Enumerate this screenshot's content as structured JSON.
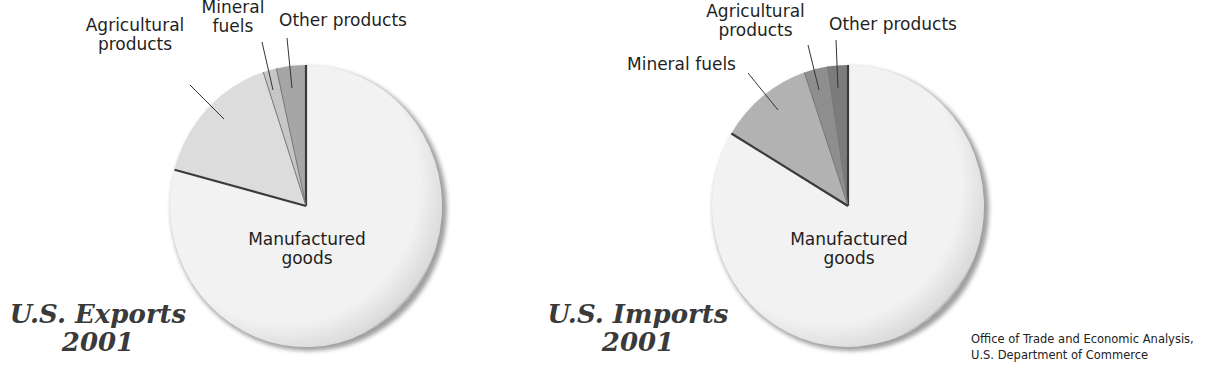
{
  "chart_data": [
    {
      "type": "pie",
      "title": "U.S. Exports 2001",
      "title_lines": [
        "U.S. Exports",
        "2001"
      ],
      "categories": [
        "Manufactured goods",
        "Agricultural products",
        "Mineral fuels",
        "Other products"
      ],
      "values": [
        79.3,
        15.8,
        1.6,
        3.5
      ],
      "unit": "% (estimated from wedge angles)",
      "colors": [
        "#f2f2f2",
        "#dcdcdc",
        "#c6c6c6",
        "#a6a6a6"
      ],
      "legend": "none (callout labels)",
      "start": "12 o'clock, small wedges counter-clockwise: Other, Mineral fuels, Agricultural"
    },
    {
      "type": "pie",
      "title": "U.S. Imports 2001",
      "title_lines": [
        "U.S. Imports",
        "2001"
      ],
      "categories": [
        "Manufactured goods",
        "Mineral fuels",
        "Agricultural products",
        "Other products"
      ],
      "values": [
        83.6,
        11.2,
        2.8,
        2.4
      ],
      "unit": "% (estimated from wedge angles)",
      "colors": [
        "#f2f2f2",
        "#b2b2b2",
        "#8e8e8e",
        "#7c7c7c"
      ],
      "legend": "none (callout labels)",
      "start": "12 o'clock, small wedges counter-clockwise: Other, Agricultural, Mineral fuels"
    }
  ],
  "exports": {
    "title_line1": "U.S. Exports",
    "title_line2": "2001",
    "labels": {
      "manufactured_1": "Manufactured",
      "manufactured_2": "goods",
      "agricultural_1": "Agricultural",
      "agricultural_2": "products",
      "mineral_1": "Mineral",
      "mineral_2": "fuels",
      "other": "Other products"
    }
  },
  "imports": {
    "title_line1": "U.S. Imports",
    "title_line2": "2001",
    "labels": {
      "manufactured_1": "Manufactured",
      "manufactured_2": "goods",
      "agricultural_1": "Agricultural",
      "agricultural_2": "products",
      "mineral": "Mineral fuels",
      "other": "Other products"
    }
  },
  "source": {
    "line1": "Office of Trade and Economic Analysis,",
    "line2": "U.S. Department of Commerce"
  }
}
